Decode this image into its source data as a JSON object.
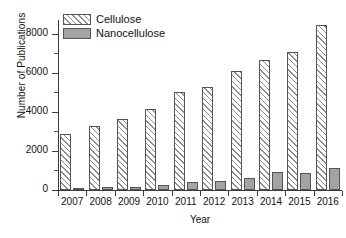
{
  "chart_data": {
    "type": "bar",
    "title": "",
    "xlabel": "Year",
    "ylabel": "Number of Publications",
    "categories": [
      "2007",
      "2008",
      "2009",
      "2010",
      "2011",
      "2012",
      "2013",
      "2014",
      "2015",
      "2016"
    ],
    "series": [
      {
        "name": "Cellulose",
        "color": "#ffffff",
        "pattern": "diagonal-hatch",
        "values": [
          2880,
          3290,
          3610,
          4170,
          4990,
          5290,
          6110,
          6640,
          7070,
          8440
        ]
      },
      {
        "name": "Nanocellulose",
        "color": "#a3a3a3",
        "pattern": "solid",
        "values": [
          110,
          140,
          170,
          250,
          390,
          480,
          590,
          900,
          890,
          1150
        ]
      }
    ],
    "ylim": [
      0,
      8800
    ],
    "yticks": [
      0,
      2000,
      4000,
      6000,
      8000
    ],
    "ytick_labels": [
      "0",
      "2000",
      "4000",
      "6000",
      "8000"
    ],
    "yminor_ticks": [
      1000,
      3000,
      5000,
      7000
    ],
    "grid": false,
    "legend_position": "top-left",
    "legend_entries": [
      "Cellulose",
      "Nanocellulose"
    ]
  }
}
